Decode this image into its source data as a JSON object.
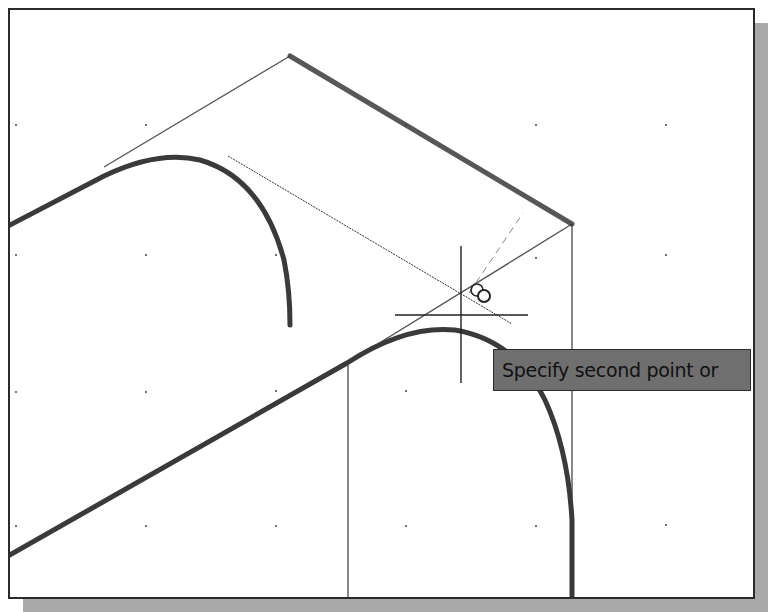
{
  "app": {
    "type": "cad-drawing-viewport"
  },
  "tooltip": {
    "text": "Specify second point or"
  },
  "cursor": {
    "type": "crosshair",
    "x": 461,
    "y": 315,
    "snap_marker": "tangent-snap"
  },
  "grid": {
    "spacing": 130,
    "x": [
      16,
      146,
      276,
      406,
      536,
      666
    ],
    "y": [
      125,
      255,
      385,
      515
    ]
  },
  "colors": {
    "background": "#ffffff",
    "frame": "#2b2b2b",
    "shadow": "#a9a9a9",
    "thick_line": "#3a3a3a",
    "thin_line": "#555555",
    "tooltip_bg": "#6f6f6f"
  }
}
